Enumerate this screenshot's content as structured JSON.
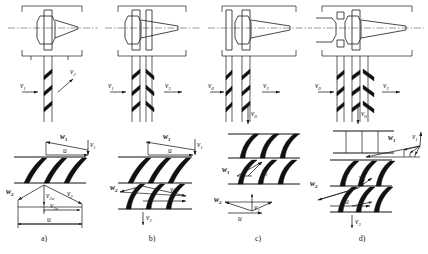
{
  "figure": {
    "type": "technical-line-diagram",
    "panel_count": 4
  },
  "captions": {
    "a": "a)",
    "b": "b)",
    "c": "c)",
    "d": "d)"
  },
  "panels": [
    {
      "id": "a",
      "caption": "a)",
      "section": {
        "blade_rows": 1,
        "flow_labels": [
          {
            "name": "v1",
            "base": "v",
            "sub": "1",
            "direction": "right",
            "position": "inlet"
          },
          {
            "name": "v2",
            "base": "v",
            "sub": "2",
            "direction": "up-right",
            "position": "outlet"
          }
        ]
      },
      "triangles": {
        "cascade_rows": 1,
        "inlet_labels": [
          {
            "name": "w1",
            "base": "w",
            "sub": "1"
          },
          {
            "name": "u",
            "base": "u",
            "sub": ""
          },
          {
            "name": "v1",
            "base": "v",
            "sub": "1"
          }
        ],
        "outlet_labels": [
          {
            "name": "w2",
            "base": "w",
            "sub": "2"
          },
          {
            "name": "v2",
            "base": "v",
            "sub": "2"
          },
          {
            "name": "v2a",
            "base": "v",
            "sub": "2a"
          },
          {
            "name": "v2u",
            "base": "v",
            "sub": "2u"
          },
          {
            "name": "u",
            "base": "u",
            "sub": ""
          }
        ]
      }
    },
    {
      "id": "b",
      "caption": "b)",
      "section": {
        "blade_rows": 2,
        "flow_labels": [
          {
            "name": "v1",
            "base": "v",
            "sub": "1",
            "direction": "right",
            "position": "inlet"
          },
          {
            "name": "v3",
            "base": "v",
            "sub": "3",
            "direction": "right",
            "position": "outlet"
          }
        ]
      },
      "triangles": {
        "cascade_rows": 2,
        "inlet_labels": [
          {
            "name": "w1",
            "base": "w",
            "sub": "1"
          },
          {
            "name": "u",
            "base": "u",
            "sub": ""
          },
          {
            "name": "v1",
            "base": "v",
            "sub": "1"
          }
        ],
        "outlet_labels": [
          {
            "name": "w2",
            "base": "w",
            "sub": "2"
          },
          {
            "name": "v2",
            "base": "v",
            "sub": "2"
          },
          {
            "name": "v3",
            "base": "v",
            "sub": "3"
          }
        ]
      }
    },
    {
      "id": "c",
      "caption": "c)",
      "section": {
        "blade_rows": 2,
        "flow_labels": [
          {
            "name": "v0",
            "base": "v",
            "sub": "0",
            "direction": "right",
            "position": "inlet"
          },
          {
            "name": "v2",
            "base": "v",
            "sub": "2",
            "direction": "right",
            "position": "outlet"
          },
          {
            "name": "v0b",
            "base": "v",
            "sub": "0",
            "direction": "down",
            "position": "bottom"
          }
        ]
      },
      "triangles": {
        "cascade_rows": 2,
        "inlet_labels": [
          {
            "name": "w1",
            "base": "w",
            "sub": "1"
          },
          {
            "name": "v1",
            "base": "v",
            "sub": "1"
          }
        ],
        "outlet_labels": [
          {
            "name": "w2",
            "base": "w",
            "sub": "2"
          },
          {
            "name": "v2",
            "base": "v",
            "sub": "2"
          },
          {
            "name": "u",
            "base": "u",
            "sub": ""
          }
        ]
      }
    },
    {
      "id": "d",
      "caption": "d)",
      "section": {
        "blade_rows": 3,
        "flow_labels": [
          {
            "name": "v0",
            "base": "v",
            "sub": "0",
            "direction": "right",
            "position": "inlet"
          },
          {
            "name": "v3",
            "base": "v",
            "sub": "3",
            "direction": "right",
            "position": "outlet"
          },
          {
            "name": "v0b",
            "base": "v",
            "sub": "0",
            "direction": "down",
            "position": "bottom"
          }
        ]
      },
      "triangles": {
        "cascade_rows": 3,
        "inlet_labels": [
          {
            "name": "w1",
            "base": "w",
            "sub": "1"
          },
          {
            "name": "v1",
            "base": "v",
            "sub": "1"
          }
        ],
        "outlet_labels": [
          {
            "name": "w2",
            "base": "w",
            "sub": "2"
          },
          {
            "name": "v2",
            "base": "v",
            "sub": "2"
          },
          {
            "name": "u",
            "base": "u",
            "sub": ""
          },
          {
            "name": "v3",
            "base": "v",
            "sub": "3"
          }
        ]
      }
    }
  ],
  "colors": {
    "line": "#1a1a1a",
    "blade_fill": "#111111",
    "centerline": "#555555",
    "background": "#ffffff"
  }
}
